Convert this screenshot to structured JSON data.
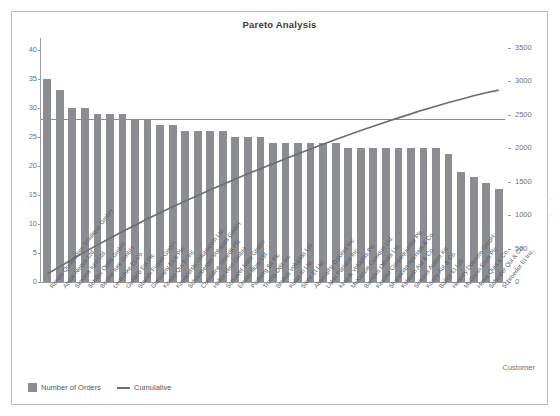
{
  "window": {
    "ghost_top_text": "·                          ·                          ·"
  },
  "card": {
    "title": "Pareto Analysis",
    "xaxis_title": "Customer"
  },
  "legend": {
    "items": [
      {
        "label": "Number of Orders",
        "marker": "square",
        "color": "#8b8d93"
      },
      {
        "label": "Cumulative",
        "marker": "line",
        "color": "#6a6d73"
      }
    ]
  },
  "chart_data": {
    "type": "bar",
    "title": "Pareto Analysis",
    "xlabel": "Customer",
    "ylabel": "",
    "y2label": "",
    "ylim": [
      0,
      42
    ],
    "y2lim": [
      0,
      3650
    ],
    "yticks": [
      0,
      5,
      10,
      15,
      20,
      25,
      30,
      35,
      40
    ],
    "y2ticks": [
      0,
      500,
      1000,
      1500,
      2000,
      2500,
      3000,
      3500
    ],
    "grid": false,
    "legend_position": "bottom-left",
    "reference_line": {
      "label": "",
      "y_left": 28,
      "y_right": 2400,
      "color": "#8a8d93"
    },
    "categories": [
      "Rerum Quibusdam Similique GmbH",
      "Atque Neque Ltd.",
      "Simonis Iure Ltd.",
      "Schiller Optio GmbH",
      "Becker Iure GmbH",
      "Leuschke Et Co.",
      "Gottlieb Est Plc",
      "Stamm Fugiat GmbH",
      "Gorczany Eius Plc",
      "Koepp Qui Et Inc",
      "Konopelski Voluptatem Ltd.",
      "Schamberger Voluptas GmbH",
      "Considine Impedit Plc",
      "Heller Vero GmbH",
      "Schuster Iusto GmbH",
      "Ernser Illum Ltd.",
      "Padberg Sit Plc",
      "Tromp Odit Inc",
      "Brakus Voluptas Ltd.",
      "Kulas In Ltd.",
      "Stehr Et Ltd.",
      "Abernathy Dolores Inc",
      "Lakin Pariatur Inc",
      "Krajcik Voluptas Plc",
      "McKenzie Cumque Ltd.",
      "Barrows Officiis Ltd.",
      "Kessler Consequuntur Plc",
      "Shanahan Aperiam & Co.",
      "Kshlerin Aut & Co.",
      "Simonis Autem Inc",
      "Kozey Aut & Co.",
      "Bailey Et Ltd.",
      "Heaney Dolorem GmbH",
      "McGlynn Enim Plc",
      "Howe Quia & Co.",
      "Schuster Qui & Co.",
      "Schroeder Et Inc."
    ],
    "series": [
      {
        "name": "Number of Orders",
        "type": "bar",
        "axis": "left",
        "color": "#8b8d93",
        "values": [
          35,
          33,
          30,
          30,
          29,
          29,
          29,
          28,
          28,
          27,
          27,
          26,
          26,
          26,
          26,
          25,
          25,
          25,
          24,
          24,
          24,
          24,
          24,
          24,
          23,
          23,
          23,
          23,
          23,
          23,
          23,
          23,
          22,
          19,
          18,
          17,
          16
        ]
      },
      {
        "name": "Cumulative",
        "type": "line",
        "axis": "right",
        "color": "#6a6d73",
        "values": [
          120,
          230,
          340,
          450,
          555,
          655,
          755,
          850,
          945,
          1035,
          1125,
          1210,
          1295,
          1380,
          1460,
          1540,
          1620,
          1695,
          1770,
          1845,
          1920,
          1990,
          2060,
          2130,
          2200,
          2265,
          2330,
          2395,
          2455,
          2515,
          2575,
          2630,
          2685,
          2735,
          2785,
          2830,
          2870
        ]
      }
    ]
  }
}
